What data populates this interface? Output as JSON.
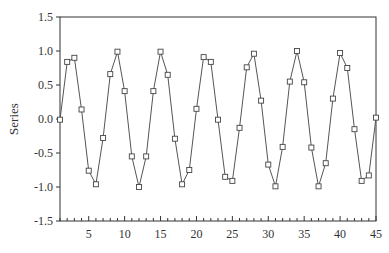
{
  "chart_data": {
    "type": "line",
    "title": "",
    "xlabel": "",
    "ylabel": "Series",
    "xlim": [
      1,
      45
    ],
    "ylim": [
      -1.5,
      1.5
    ],
    "x_ticks": [
      5,
      10,
      15,
      20,
      25,
      30,
      35,
      40,
      45
    ],
    "y_ticks": [
      -1.5,
      -1.0,
      -0.5,
      0.0,
      0.5,
      1.0,
      1.5
    ],
    "y_tick_labels": [
      "-1.5",
      "-1.0",
      "-0.5",
      "0.0",
      "0.5",
      "1.0",
      "1.5"
    ],
    "grid": false,
    "legend": null,
    "marker": "square",
    "series": [
      {
        "name": "Series",
        "x": [
          1,
          2,
          3,
          4,
          5,
          6,
          7,
          8,
          9,
          10,
          11,
          12,
          13,
          14,
          15,
          16,
          17,
          18,
          19,
          20,
          21,
          22,
          23,
          24,
          25,
          26,
          27,
          28,
          29,
          30,
          31,
          32,
          33,
          34,
          35,
          36,
          37,
          38,
          39,
          40,
          41,
          42,
          43,
          44,
          45
        ],
        "values": [
          -0.01,
          0.84,
          0.9,
          0.14,
          -0.76,
          -0.96,
          -0.28,
          0.66,
          0.99,
          0.41,
          -0.55,
          -1.0,
          -0.55,
          0.41,
          0.99,
          0.65,
          -0.29,
          -0.96,
          -0.75,
          0.15,
          0.91,
          0.84,
          -0.01,
          -0.85,
          -0.91,
          -0.13,
          0.76,
          0.96,
          0.27,
          -0.67,
          -0.99,
          -0.41,
          0.55,
          1.0,
          0.54,
          -0.42,
          -0.99,
          -0.65,
          0.3,
          0.97,
          0.75,
          -0.15,
          -0.91,
          -0.83,
          0.02
        ]
      }
    ]
  },
  "colors": {
    "line": "#555555",
    "marker_edge": "#444444",
    "axis": "#333333",
    "background": "#ffffff"
  }
}
